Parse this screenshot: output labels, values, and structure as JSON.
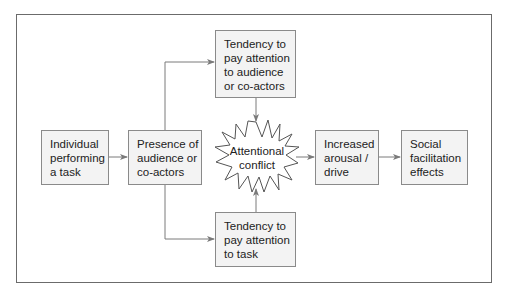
{
  "diagram": {
    "nodes": {
      "individual": {
        "lines": [
          "Individual",
          "performing",
          "a task"
        ]
      },
      "presence": {
        "lines": [
          "Presence of",
          "audience or",
          "co-actors"
        ]
      },
      "attend_audience": {
        "lines": [
          "Tendency to",
          "pay attention",
          "to audience",
          "or co-actors"
        ]
      },
      "attend_task": {
        "lines": [
          "Tendency to",
          "pay attention",
          "to task"
        ]
      },
      "conflict": {
        "lines": [
          "Attentional",
          "conflict"
        ]
      },
      "arousal": {
        "lines": [
          "Increased",
          "arousal /",
          "drive"
        ]
      },
      "effects": {
        "lines": [
          "Social",
          "facilitation",
          "effects"
        ]
      }
    },
    "edges": [
      {
        "from": "individual",
        "to": "presence"
      },
      {
        "from": "presence",
        "to": "attend_audience"
      },
      {
        "from": "presence",
        "to": "attend_task"
      },
      {
        "from": "attend_audience",
        "to": "conflict"
      },
      {
        "from": "attend_task",
        "to": "conflict"
      },
      {
        "from": "conflict",
        "to": "arousal"
      },
      {
        "from": "arousal",
        "to": "effects"
      }
    ],
    "colors": {
      "box_fill": "#f3f3f3",
      "box_border": "#8a8a8a",
      "arrow": "#7a7a7a",
      "frame": "#6b6b6b",
      "text": "#222222"
    }
  }
}
